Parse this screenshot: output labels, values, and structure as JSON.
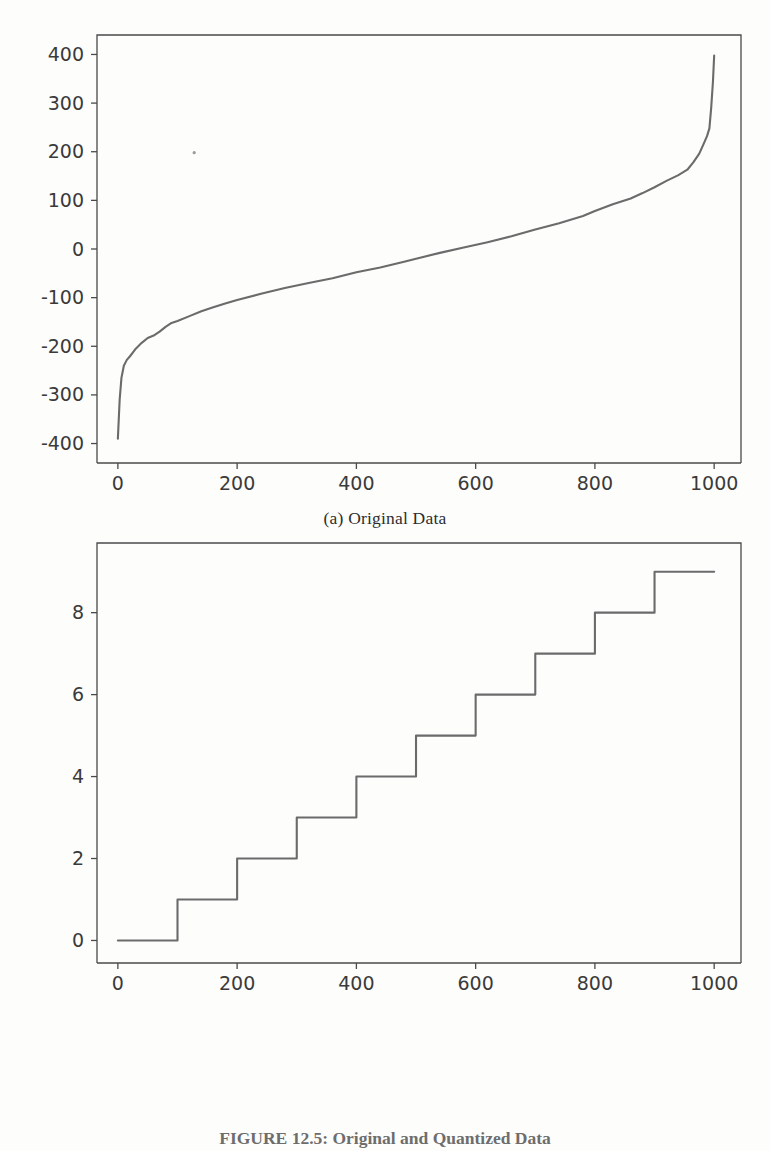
{
  "document": {
    "figure_caption": "FIGURE 12.5: Original and Quantized Data",
    "background_color": "#fdfdfc",
    "line_color": "#6b6b6b",
    "axis_color": "#4a4a4a"
  },
  "subplots": [
    {
      "id": "a",
      "caption": "(a) Original Data"
    },
    {
      "id": "b",
      "caption": "(b) Quantized Data"
    }
  ],
  "chart_data": [
    {
      "type": "line",
      "title": "(a) Original Data",
      "xlabel": "",
      "ylabel": "",
      "xlim": [
        -35,
        1045
      ],
      "ylim": [
        -440,
        440
      ],
      "grid": false,
      "legend": null,
      "xticks": [
        0,
        200,
        400,
        600,
        800,
        1000
      ],
      "xticklabels": [
        "0",
        "200",
        "400",
        "600",
        "800",
        "1000"
      ],
      "yticks": [
        -400,
        -300,
        -200,
        -100,
        0,
        100,
        200,
        300,
        400
      ],
      "yticklabels": [
        "-400",
        "-300",
        "-200",
        "-100",
        "0",
        "100",
        "200",
        "300",
        "400"
      ],
      "description": "Sorted Gaussian-like sample values, monotonically increasing S-curve",
      "x": [
        0,
        3,
        6,
        10,
        15,
        20,
        25,
        30,
        40,
        50,
        60,
        70,
        80,
        90,
        100,
        120,
        140,
        160,
        180,
        200,
        240,
        280,
        320,
        360,
        400,
        440,
        480,
        500,
        540,
        580,
        620,
        660,
        700,
        740,
        780,
        800,
        830,
        860,
        880,
        900,
        920,
        940,
        955,
        965,
        975,
        982,
        988,
        992,
        995,
        998,
        1000
      ],
      "y": [
        -390,
        -310,
        -265,
        -240,
        -228,
        -221,
        -213,
        -205,
        -193,
        -183,
        -178,
        -170,
        -160,
        -152,
        -148,
        -138,
        -128,
        -120,
        -112,
        -105,
        -92,
        -80,
        -70,
        -60,
        -48,
        -38,
        -26,
        -20,
        -8,
        3,
        14,
        26,
        40,
        53,
        68,
        78,
        92,
        104,
        115,
        127,
        140,
        152,
        163,
        178,
        196,
        215,
        232,
        248,
        290,
        345,
        398
      ],
      "stray_marks": [
        {
          "x": 128,
          "y": 198
        }
      ]
    },
    {
      "type": "line",
      "title": "(b) Quantized Data",
      "xlabel": "",
      "ylabel": "",
      "xlim": [
        -35,
        1045
      ],
      "ylim": [
        -0.55,
        9.7
      ],
      "grid": false,
      "legend": null,
      "xticks": [
        0,
        200,
        400,
        600,
        800,
        1000
      ],
      "xticklabels": [
        "0",
        "200",
        "400",
        "600",
        "800",
        "1000"
      ],
      "yticks": [
        0,
        2,
        4,
        6,
        8
      ],
      "yticklabels": [
        "0",
        "2",
        "4",
        "6",
        "8"
      ],
      "description": "Staircase quantization: 10 levels (0 through 9), each level spanning 100 samples",
      "step_edges": [
        0,
        100,
        200,
        300,
        400,
        500,
        600,
        700,
        800,
        900,
        1000
      ],
      "step_levels": [
        0,
        1,
        2,
        3,
        4,
        5,
        6,
        7,
        8,
        9
      ]
    }
  ]
}
